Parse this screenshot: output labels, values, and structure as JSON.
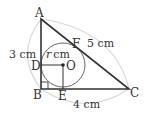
{
  "figure": {
    "type": "right triangle with inscribed circle",
    "points": {
      "A": "A",
      "B": "B",
      "C": "C",
      "D": "D",
      "E": "E",
      "F": "F",
      "O": "O"
    },
    "measurements": {
      "AB": "3 cm",
      "AC": "5 cm",
      "BC": "4 cm",
      "radius": "cm",
      "radius_var": "r"
    },
    "colors": {
      "lines": "#333333",
      "circle": "#666666",
      "dimension_arcs": "#d8d8d8"
    }
  }
}
